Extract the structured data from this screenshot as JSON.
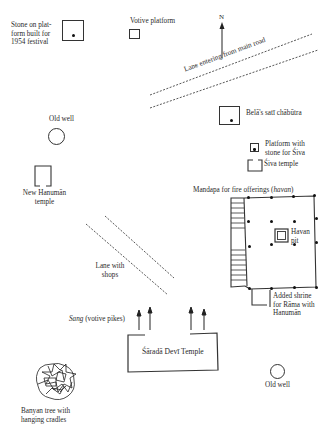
{
  "diagram": {
    "type": "site-plan",
    "compass": "N",
    "labels": {
      "stone_platform": [
        "Stone on plat-",
        "form built for",
        "1954 festival"
      ],
      "votive_platform": "Votive platform",
      "lane_main_road": "Lane entering from main road",
      "belas_sati": "Belā's satī chābūtra",
      "old_well_top": "Old well",
      "platform_shiva": [
        "Platform with",
        "stone for Śiva"
      ],
      "shiva_temple": "Śiva temple",
      "new_hanuman": [
        "New Hanumān",
        "temple"
      ],
      "mandapa_prefix": "Mandapa for fire offerings (",
      "mandapa_italic": "havan",
      "mandapa_suffix": ")",
      "havan_pit": [
        "Havan",
        "pit"
      ],
      "lane_shops": [
        "Lane with",
        "shops"
      ],
      "added_shrine": [
        "Added shrine",
        "for Rāma with",
        "Hanumān"
      ],
      "sang_italic": "Sang",
      "sang_rest": " (votive pikes)",
      "sarada_temple": "Śāradā Devī Temple",
      "old_well_bottom": "Old well",
      "banyan": [
        "Banyan tree with",
        "hanging cradles"
      ]
    }
  }
}
